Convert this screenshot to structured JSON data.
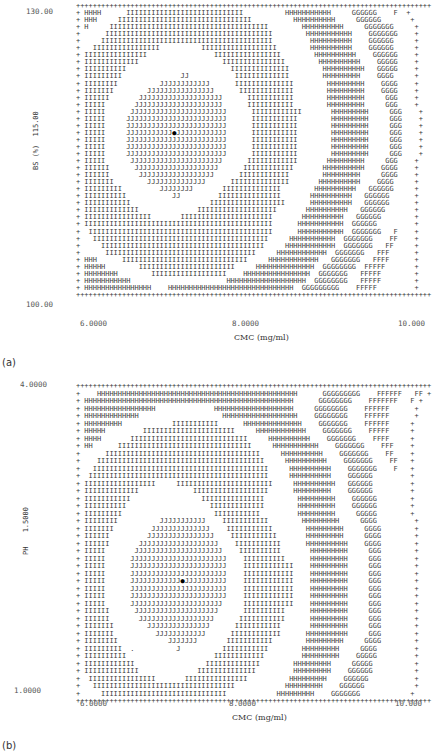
{
  "charts": [
    {
      "panel_label": "(a)",
      "ylabel": "BS (%)",
      "xlabel": "CMC (mg/ml)",
      "y_ticks": {
        "top": "130.00",
        "mid": "115.00",
        "bottom": "100.00"
      },
      "x_ticks": {
        "left": "6.0000",
        "mid": "8.0000",
        "right": "10.000"
      },
      "rows": [
        "+++++++++++++++++++++++++++++++++++++++++++++++++++++++++++++++++++++++++++++++++++++",
        "+ HHHH      IIIIIIIIIIIIIIIIIIIIIIIIIIII          HHHHHHHHHHH     GGGGGG    F  +",
        "+ HHH     IIIIIIIIIIIIIIIIIIIIIIIIIIIIIIII          HHHHHHHHHH     GGGGGG       +",
        "+ H     IIIIIIIIIIIIIIIIIIIIIIIIIIIIIIIIIIIIII        HHHHHHHHHH     GGGGGGG     +",
        "+      IIIIIIIIIIIIIIIIIIIIIIIIIIIIIIIIIIIIIIII        HHHHHHHHHHH    GGGGGGG    +",
        "+     IIIIIIIIIIIIIIIIIIIIIIIIIIIIIIIIIIIIIIIII         HHHHHHHHHH    GGGGGG     +",
        "+   IIIIIIIIIIIIIIII          IIIIIIIIIIIIIIIIII        HHHHHHHHHH    GGGGGG     +",
        "+ IIIIIIIIIIIIIII                IIIIIIIIIIIIIIII        HHHHHHHHHH    GGGGGG    +",
        "+ IIIIIIIIIIIII                    IIIIIIIIIIIIIII        HHHHHHHHHH    GGGGG    +",
        "+ IIIIIIIIII                         IIIIIIIIIIIIII        HHHHHHHHHH   GGGGG    +",
        "+ IIIIIIIII              JJ           IIIIIIIIIIIII        HHHHHHHHH    GGGG     +",
        "+ IIIIIIII          JJJJJJJJJJJJ      IIIIIIIIIIIIII        HHHHHHHHH    GGGG    +",
        "+ IIIIIII        JJJJJJJJJJJJJJJJ      IIIIIIIIIIIII        HHHHHHHHH    GGGG    +",
        "+ IIIIII       JJJJJJJJJJJJJJJJJJJJ      IIIIIIIIIII        HHHHHHHHH     GGG    +",
        "+ IIIII       JJJJJJJJJJJJJJJJJJJJJ      IIIIIIIIIII        HHHHHHHHH     GGG    +",
        "+ IIIII      JJJJJJJJJJJJJJJJJJJJJJJ      IIIIIIIIIIII       HHHHHHHHH     GGG    +",
        "+ IIIII     JJJJJJJJJJJJJJJJJJJJJJJJ      IIIIIIIIIII        HHHHHHHHH     GGG    +",
        "+ IIIII     JJJJJJJJJJJJJJJJJJJJJJJJ      IIIIIIIIIII        HHHHHHHHH     GGG    +",
        "+ IIIII     JJJJJJJJJJJ@JJJJJJJJJJJJ      IIIIIIIIIII        HHHHHHHHH     GGG    +",
        "+ IIIII     JJJJJJJJJJJJJJJJJJJJJJJJ      IIIIIIIIIII        HHHHHHHHH     GGG    +",
        "+ IIIII     JJJJJJJJJJJJJJJJJJJJJJJJ      IIIIIIIIIII        HHHHHHHHH     GGG    +",
        "+ IIIII     JJJJJJJJJJJJJJJJJJJJJJJJ      IIIIIIIIIII        HHHHHHHHH     GGG    +",
        "+ IIIII      JJJJJJJJJJJJJJJJJJJJJJ      IIIIIIIIIIII       HHHHHHHHH     GGG    +",
        "+ IIIIII      JJJJJJJJJJJJJJJJJJJJ      IIIIIIIIIIII       HHHHHHHHHH    GGGG    +",
        "+ IIIIII       JJJJJJJJJJJJJJJJJJ      IIIIIIIIIIII        HHHHHHHHH     GGGG    +",
        "+ IIIIIII        JJJJJJJJJJJJJJ      IIIIIIIIIIIIII       HHHHHHHHHH    GGGG     +",
        "+ IIIIIIIII         JJJJJJJJ       IIIIIIIIIIIIII        HHHHHHHHHH   GGGGGG     +",
        "+ IIIIIIIIII           JJ         IIIIIIIIIIIIIII       HHHHHHHHHH   GGGGGG      +",
        "+ IIIIIIIIIII                   IIIIIIIIIIIIIIIIII      HHHHHHHHHH   GGGGGG      +",
        "+ IIIIIIIIIIIII              IIIIIIIIIIIIIIIIIII       HHHHHHHHHH   GGGGGG       +",
        "+ IIIIIIIIIIIIIIII       IIIIIIIIIIIIIIIIIIIIII       HHHHHHHHHH   GGGGGG        +",
        "+ IIIIIIIIIIIIIIIIIIIIIIIIIIIIIIIIIIIIIIIIIIIII      HHHHHHHHHHH  GGGGGG         +",
        "+  IIIIIIIIIIIIIIIIIIIIIIIIIIIIIIIIIIIIIIIIIIII      HHHHHHHHHHH  GGGGGGG   F    +",
        "+   IIIIIIIIIIIIIIIIIIIIIIIIIIIIIIIIIIIIIIIIII     HHHHHHHHHHH  GGGGGGG    FF    +",
        "+     IIIIIIIIIIIIIIIIIIIIIIIIIIIIIIIIIIIIIII     HHHHHHHHHHHH  GGGGGGG   FF     +",
        "+      IIIIIIIIIIIIIIIIIIIIIIIIIIIIIIIIIIII     HHHHHHHHHHHH  GGGGGGG   FFF      +",
        "+ HHH      IIIIIIIIIIIIIIIIIIIIIIIIIIIIII     HHHHHHHHHHHH   GGGGGGG   FFFF      +",
        "+ HHHHH        IIIIIIIIIIIIIIIIIIIIIII     HHHHHHHHHHHHHH  GGGGGGGG  FFFFF       +",
        "+ HHHHHHHH        IIIIIIIIIIIIIIIIII    HHHHHHHHHHHHHHHH  GGGGGGG   FFFFF        +",
        "+ HHHHHHHHHHH                       HHHHHHHHHHHHHHHHHHH  GGGGGGGG   FFFFF        +",
        "+ HHHHHHHHHHHHHHHH    HHHHHHHHHHHHHHHHHHHHHHHHHHHHHH  GGGGGGGGG    FFFFF         +",
        "+++++++++++++++++++++++++++++++++++++++++++++++++++++++++++++++++++++++++++++++++++++"
      ]
    },
    {
      "panel_label": "(b)",
      "ylabel": "PH",
      "xlabel": "CMC (mg/ml)",
      "y_ticks": {
        "top": "4.0000",
        "mid": "1.5000",
        "bottom": "1.0000"
      },
      "x_ticks": {
        "left": "6.0000",
        "mid": "8.0000",
        "right": "10.000"
      },
      "rows": [
        "+++++++++++++++++++++++++++++++++++++++++++++++++++++++++++++++++++++++++++++++++++++",
        "+    HHHHHHHHHHHHHHHHHHHHHHHHHHHHHHHHHHHHHHHHHHHHHHHH      GGGGGGGGG    FFFFFF   FF +",
        "+ HHHHHHHHHHHHHHHHHHHHHHHHHHHHHHHHHHHHHHHHHHHHHHHHHH      GGGGGGGG    FFFFFFF   F +",
        "+ HHHHHHHHHHHHHHHHH              HHHHHHHHHHHHHHHHHHH     GGGGGGGG    FFFFFF      +",
        "+ HHHHHHHHHHHHH                    HHHHHHHHHHHHHHHHHH    GGGGGGGG    FFFFFF      +",
        "+ HHHHHHHHH            IIIIIIIIIII      HHHHHHHHHHHHHH    GGGGGGG    FFFFFF     +",
        "+ HHHHH         IIIIIIIIIIIIIIIIIIIIII     HHHHHHHHHHHH    GGGGGGG    FFFFF     +",
        "+ HHHH       IIIIIIIIIIIIIIIIIIIIIIIIIIII     HHHHHHHHHH    GGGGGGG    FFFF     +",
        "+ HH      IIIIIIIIIIIIIIIIIIIIIIIIIIIIIIII     HHHHHHHHHHH    GGGGGGG    FFF    +",
        "+      IIIIIIIIIIIIIIIIIIIIIIIIIIIIIIIIIIIII     HHHHHHHHHH    GGGGGGG    FF    +",
        "+    IIIIIIIIIIIIIIIIIIIIIIIIIIIIIIIIIIIIIIII     HHHHHHHHHH    GGGGGGG    FF   +",
        "+   IIIIIIIIIIIIIIIIIIIIIIIIIIIIIIIIIIIIIIIIII     HHHHHHHHHH    GGGGGGG    F   +",
        "+  IIIIIIIIIIIIIIIIIIIIIIIIIIIIIIIIIIIIIIIIIII     HHHHHHHHHH    GGGGGG         +",
        "+ IIIIIIIIIIIIIIIII     IIIIIIIIIIIIIIIIIIIIIII     HHHHHHHHHH   GGGGGG         +",
        "+ IIIIIIIIIIIII             IIIIIIIIIIIIIIIIII      HHHHHHHHH    GGGGGG         +",
        "+ IIIIIIIIIII                 IIIIIIIIIIIIIII        HHHHHHHHH    GGGGGG        +",
        "+ IIIIIIIIII                    IIIIIIIIIIIII        HHHHHHHHH    GGGGGG        +",
        "+ IIIIIIIII                      IIIIIIIIIII         HHHHHHHHH     GGGGG        +",
        "+ IIIIIIII          JJJJJJJJJJJ    IIIIIIIIIII        HHHHHHHHH     GGGG         +",
        "+ IIIIIII         JJJJJJJJJJJJJJ    IIIIIIIIIII        HHHHHHHHH     GGGG        +",
        "+ IIIIII         JJJJJJJJJJJJJJJJ    IIIIIIIIIII       HHHHHHHHH     GGGG        +",
        "+ IIIIII       JJJJJJJJJJJJJJJJJJJ    IIIIIIIIIII      HHHHHHHHHH    GGGG        +",
        "+ IIIII       JJJJJJJJJJJJJJJJJJJJJ    IIIIIIIIII       HHHHHHHHH     GGG        +",
        "+ IIIII      JJJJJJJJJJJJJJJJJJJJJJJ    IIIIIIIIII      HHHHHHHHH     GGG        +",
        "+ IIIII      JJJJJJJJJJJJJJJJJJJJJJJ    IIIIIIIIIIII    HHHHHHHHH     GGG        +",
        "+ IIIII      JJJJJJJJJJJJJJJJJJJJJJJ    IIIIIIIIIIII    HHHHHHHHH     GGG        +",
        "+ IIIII      JJJJJJJJJJJJ@JJJJJJJJJJ    IIIIIIIIIIII    HHHHHHHHH     GGG        +",
        "+ IIIII      JJJJJJJJJJJJJJJJJJJJJJJ    IIIIIIIIIIII    HHHHHHHHH     GGG        +",
        "+ IIIII      JJJJJJJJJJJJJJJJJJJJJJJ    IIIIIIIIIIII    HHHHHHHHH     GGG        +",
        "+ IIIII      JJJJJJJJJJJJJJJJJJJJJJ     IIIIIIIIIIII    HHHHHHHHH     GGG        +",
        "+ IIIIII      JJJJJJJJJJJJJJJJJJJJ      IIIIIIIIII      HHHHHHHHH     GGG        +",
        "+ IIIIII       JJJJJJJJJJJJJJJJJJ      IIIIIIIIIII      HHHHHHHHH     GGG        +",
        "+ IIIIIII        JJJJJJJJJJJJJJJ      IIIIIIIIIII       HHHHHHHHH     GGG        +",
        "+ IIIIIII          JJJJJJJJJJJJ      IIIIIIIIIIII      HHHHHHHHHH     GGG        +",
        "+ IIIIIIII            JJJJJJJ       IIIIIIIIIII        HHHHHHHHH     GGGG        +",
        "+ IIIIIIIII  .          J          IIIIIIIIIII        HHHHHHHHH     GGGG         +",
        "+ IIIIIIIIII                     IIIIIIIIIIII         HHHHHHHHH    GGGGG         +",
        "+ IIIIIIIIIIII                 IIIIIIIIIIIII        HHHHHHHHH     GGGGG          +",
        "+ IIIIIIIIIIIII              IIIIIIIIIIIIII         HHHHHHHHH    GGGGGG          +",
        "+  IIIIIIIIIIIIIIII       IIIIIIIIIIIIIII          HHHHHHHHH    GGGGGG           +",
        "+   IIIIIIIIIIIIIIIIIIIIIIIIIIIIIIIIII            HHHHHHHHH    GGGGGG            +",
        "+     IIIIIIIIIIIIIIIIIIIIIIIIIIIIII            HHHHHHHHH    GGGGGGG            +",
        "+++++++++++++++++++++++++++++++++++++++++++++++++++++++++++++++++++++++++++++++++++++"
      ]
    }
  ],
  "chart_data": [
    {
      "type": "heatmap",
      "title": "(a) contour plot (line-printer)",
      "xlabel": "CMC (mg/ml)",
      "ylabel": "BS (%)",
      "xlim": [
        6.0,
        10.0
      ],
      "ylim": [
        100.0,
        130.0
      ],
      "x_tick_labels": [
        "6.0000",
        "8.0000",
        "10.000"
      ],
      "y_tick_labels": [
        "100.00",
        "115.00",
        "130.00"
      ],
      "contour_levels_letters": [
        "J",
        "I",
        "H",
        "G",
        "F"
      ],
      "optimum_marker": {
        "x": 7.3,
        "y": 117.5,
        "symbol": "filled dot"
      },
      "grid": false,
      "legend": "none"
    },
    {
      "type": "heatmap",
      "title": "(b) contour plot (line-printer)",
      "xlabel": "CMC (mg/ml)",
      "ylabel": "PH",
      "xlim": [
        6.0,
        10.0
      ],
      "ylim": [
        1.0,
        4.0
      ],
      "x_tick_labels": [
        "6.0000",
        "8.0000",
        "10.000"
      ],
      "y_tick_labels": [
        "1.0000",
        "1.5000",
        "4.0000"
      ],
      "contour_levels_letters": [
        "J",
        "I",
        "H",
        "G",
        "F"
      ],
      "optimum_marker": {
        "x": 7.3,
        "y": 2.1,
        "symbol": "filled dot"
      },
      "grid": false,
      "legend": "none"
    }
  ]
}
